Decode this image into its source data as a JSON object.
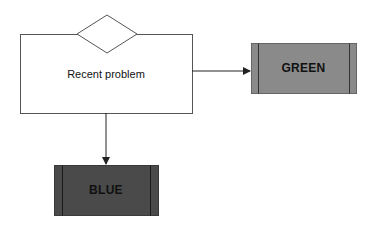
{
  "diagram": {
    "nodes": [
      {
        "id": "recent-problem",
        "type": "process-with-decision",
        "label": "Recent problem"
      },
      {
        "id": "green",
        "type": "predefined-process",
        "label": "GREEN",
        "fill": "#8a8a8a"
      },
      {
        "id": "blue",
        "type": "predefined-process",
        "label": "BLUE",
        "fill": "#4a4a4a"
      }
    ],
    "edges": [
      {
        "from": "recent-problem",
        "to": "green",
        "direction": "right"
      },
      {
        "from": "recent-problem",
        "to": "blue",
        "direction": "down"
      }
    ],
    "colors": {
      "stroke": "#555555",
      "green_fill": "#8a8a8a",
      "blue_fill": "#4a4a4a",
      "background": "#ffffff"
    }
  }
}
